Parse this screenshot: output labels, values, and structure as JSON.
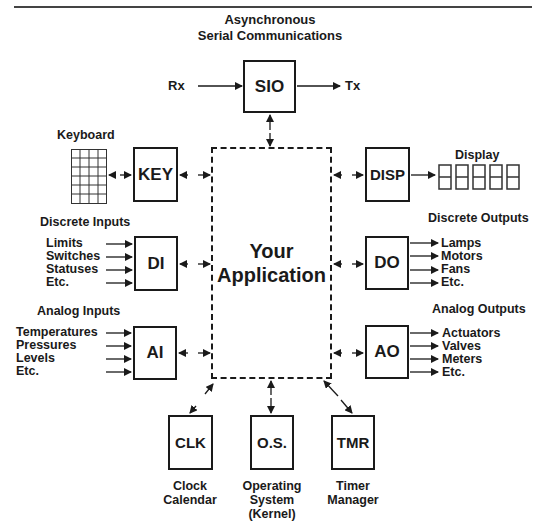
{
  "title": {
    "line1": "Asynchronous",
    "line2": "Serial Communications"
  },
  "center": {
    "line1": "Your",
    "line2": "Application"
  },
  "sio": {
    "label": "SIO",
    "rx": "Rx",
    "tx": "Tx"
  },
  "keyboard": {
    "label": "Keyboard",
    "box": "KEY",
    "grid_cols": 4,
    "grid_rows": 6
  },
  "display": {
    "label": "Display",
    "box": "DISP",
    "digits": "88888"
  },
  "discrete_inputs": {
    "heading": "Discrete Inputs",
    "box": "DI",
    "items": [
      "Limits",
      "Switches",
      "Statuses",
      "Etc."
    ]
  },
  "discrete_outputs": {
    "heading": "Discrete Outputs",
    "box": "DO",
    "items": [
      "Lamps",
      "Motors",
      "Fans",
      "Etc."
    ]
  },
  "analog_inputs": {
    "heading": "Analog Inputs",
    "box": "AI",
    "items": [
      "Temperatures",
      "Pressures",
      "Levels",
      "Etc."
    ]
  },
  "analog_outputs": {
    "heading": "Analog Outputs",
    "box": "AO",
    "items": [
      "Actuators",
      "Valves",
      "Meters",
      "Etc."
    ]
  },
  "bottom": {
    "clk": {
      "box": "CLK",
      "line1": "Clock",
      "line2": "Calendar"
    },
    "os": {
      "box": "O.S.",
      "line1": "Operating",
      "line2": "System",
      "line3": "(Kernel)"
    },
    "tmr": {
      "box": "TMR",
      "line1": "Timer",
      "line2": "Manager"
    }
  }
}
